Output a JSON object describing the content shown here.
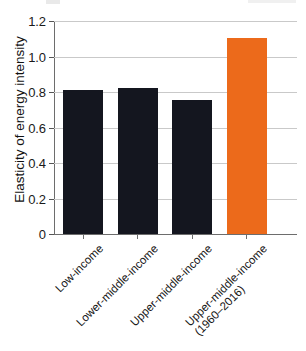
{
  "chart_data": {
    "type": "bar",
    "title": "",
    "subtitle": "",
    "xlabel": "",
    "ylabel": "Elasticity of energy intensity",
    "ylim": [
      0,
      1.2
    ],
    "yticks": [
      "0",
      "0.2",
      "0.4",
      "0.6",
      "0.8",
      "1.0",
      "1.2"
    ],
    "ytick_values": [
      0,
      0.2,
      0.4,
      0.6,
      0.8,
      1.0,
      1.2
    ],
    "grid": "horizontal",
    "legend": "none",
    "categories": [
      "Low-income",
      "Lower-middle-income",
      "Upper-middle-income",
      "Upper-middle-income (1960–2016)"
    ],
    "category_lines": [
      [
        "Low-income"
      ],
      [
        "Lower-middle-income"
      ],
      [
        "Upper-middle-income"
      ],
      [
        "Upper-middle-income",
        "(1960–2016)"
      ]
    ],
    "values": [
      0.81,
      0.82,
      0.755,
      1.105
    ],
    "bar_colors": [
      "#14161f",
      "#14161f",
      "#14161f",
      "#ec6a1b"
    ],
    "accent_color": "#ec6a1b",
    "bar_color": "#14161f",
    "axis_color": "#6d6d6d",
    "grid_color": "#c9c9c9"
  },
  "axis": {
    "y_title": "Elasticity of energy intensity"
  }
}
